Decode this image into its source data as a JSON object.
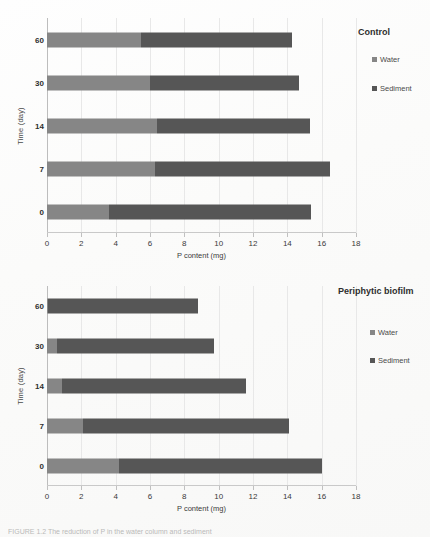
{
  "figure": {
    "caption": "FIGURE 1.2   The reduction of P in the water column and sediment"
  },
  "chart_data": [
    {
      "id": "control",
      "type": "bar",
      "orientation": "horizontal",
      "stacked": true,
      "title": "Control",
      "xlabel": "P content (mg)",
      "ylabel": "Time (day)",
      "categories": [
        "0",
        "7",
        "14",
        "30",
        "60"
      ],
      "category_order_top_to_bottom": [
        "60",
        "30",
        "14",
        "7",
        "0"
      ],
      "xlim": [
        0,
        18
      ],
      "xticks": [
        0,
        2,
        4,
        6,
        8,
        10,
        12,
        14,
        16,
        18
      ],
      "grid": true,
      "legend_position": "right",
      "series": [
        {
          "name": "Water",
          "color": "#868686",
          "values": [
            3.6,
            6.3,
            6.4,
            6.0,
            5.5
          ]
        },
        {
          "name": "Sediment",
          "color": "#565656",
          "values": [
            11.8,
            10.2,
            8.9,
            8.7,
            8.8
          ]
        }
      ],
      "totals": [
        15.4,
        16.5,
        15.3,
        14.7,
        14.3
      ]
    },
    {
      "id": "periphytic-biofilm",
      "type": "bar",
      "orientation": "horizontal",
      "stacked": true,
      "title": "Periphytic biofilm",
      "xlabel": "P content (mg)",
      "ylabel": "Time (day)",
      "categories": [
        "0",
        "7",
        "14",
        "30",
        "60"
      ],
      "category_order_top_to_bottom": [
        "60",
        "30",
        "14",
        "7",
        "0"
      ],
      "xlim": [
        0,
        18
      ],
      "xticks": [
        0,
        2,
        4,
        6,
        8,
        10,
        12,
        14,
        16,
        18
      ],
      "grid": true,
      "legend_position": "right",
      "series": [
        {
          "name": "Water",
          "color": "#868686",
          "values": [
            4.2,
            2.1,
            0.85,
            0.6,
            0.05
          ]
        },
        {
          "name": "Sediment",
          "color": "#565656",
          "values": [
            11.8,
            12.0,
            10.75,
            9.1,
            8.75
          ]
        }
      ],
      "totals": [
        16.0,
        14.1,
        11.6,
        9.7,
        8.8
      ]
    }
  ],
  "panels": {
    "top": {
      "legend_title": "Control",
      "legend_items": [
        {
          "label": "Water",
          "color": "#868686"
        },
        {
          "label": "Sediment",
          "color": "#565656"
        }
      ],
      "ylabel": "Time (day)",
      "xlabel": "P content (mg)",
      "yticks": [
        "60",
        "30",
        "14",
        "7",
        "0"
      ],
      "xticks": [
        "0",
        "2",
        "4",
        "6",
        "8",
        "10",
        "12",
        "14",
        "16",
        "18"
      ]
    },
    "bottom": {
      "legend_title": "Periphytic biofilm",
      "legend_items": [
        {
          "label": "Water",
          "color": "#868686"
        },
        {
          "label": "Sediment",
          "color": "#565656"
        }
      ],
      "ylabel": "Time (day)",
      "xlabel": "P content (mg)",
      "yticks": [
        "60",
        "30",
        "14",
        "7",
        "0"
      ],
      "xticks": [
        "0",
        "2",
        "4",
        "6",
        "8",
        "10",
        "12",
        "14",
        "16",
        "18"
      ]
    }
  }
}
